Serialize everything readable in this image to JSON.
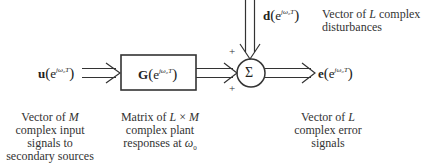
{
  "diagram": {
    "type": "block-diagram",
    "title": "",
    "signals": {
      "input": {
        "symbol": "u",
        "argument": "e",
        "exponent": "jω₀T",
        "label": "u(e^{jω₀T})"
      },
      "plant": {
        "symbol": "G",
        "argument": "e",
        "exponent": "jω₀T",
        "label": "G(e^{jω₀T})"
      },
      "disturbance": {
        "symbol": "d",
        "argument": "e",
        "exponent": "jω₀T",
        "label": "d(e^{jω₀T})"
      },
      "error": {
        "symbol": "e",
        "argument": "e",
        "exponent": "jω₀T",
        "label": "e(e^{jω₀T})"
      }
    },
    "summing_junction": {
      "symbol": "Σ",
      "signs": [
        "+",
        "+"
      ]
    },
    "descriptions": {
      "input": [
        "Vector of M",
        "complex input",
        "signals to",
        "secondary sources"
      ],
      "plant": [
        "Matrix of L × M",
        "complex plant",
        "responses at ω₀"
      ],
      "error": [
        "Vector of L",
        "complex error",
        "signals"
      ],
      "disturbance": [
        "Vector of L complex",
        "disturbances"
      ]
    },
    "colors": {
      "line": "#333333",
      "text": "#222222",
      "background": "#ffffff"
    }
  },
  "nodes": [
    {
      "id": "input",
      "label": "u(e^{jω₀T})"
    },
    {
      "id": "plant",
      "label": "G(e^{jω₀T})",
      "shape": "rectangle"
    },
    {
      "id": "sum",
      "label": "Σ",
      "shape": "circle"
    },
    {
      "id": "disturbance",
      "label": "d(e^{jω₀T})"
    },
    {
      "id": "error",
      "label": "e(e^{jω₀T})"
    }
  ],
  "edges": [
    {
      "from": "input",
      "to": "plant",
      "style": "double-line-arrow"
    },
    {
      "from": "plant",
      "to": "sum",
      "sign": "+",
      "style": "double-line-arrow"
    },
    {
      "from": "disturbance",
      "to": "sum",
      "sign": "+",
      "style": "double-line-arrow"
    },
    {
      "from": "sum",
      "to": "error",
      "style": "double-line-arrow"
    }
  ]
}
